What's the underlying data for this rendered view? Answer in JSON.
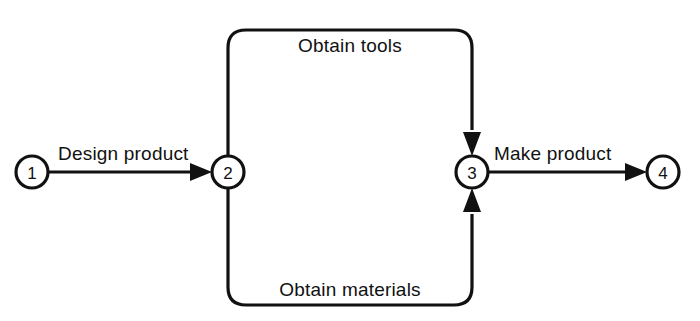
{
  "diagram": {
    "type": "activity-on-arrow-network",
    "title": "",
    "background_color": "#ffffff",
    "line_color": "#111111",
    "nodes": [
      {
        "id": "1",
        "label": "1",
        "cx": 32,
        "cy": 172,
        "r": 16
      },
      {
        "id": "2",
        "label": "2",
        "cx": 228,
        "cy": 172,
        "r": 16
      },
      {
        "id": "3",
        "label": "3",
        "cx": 472,
        "cy": 172,
        "r": 16
      },
      {
        "id": "4",
        "label": "4",
        "cx": 663,
        "cy": 172,
        "r": 16
      }
    ],
    "edges": [
      {
        "id": "design-product",
        "label": "Design product",
        "from": "1",
        "to": "2",
        "direction": "right",
        "label_x": 58,
        "label_y": 160
      },
      {
        "id": "obtain-tools",
        "label": "Obtain tools",
        "from": "2",
        "to": "3",
        "direction": "down",
        "route": "top",
        "label_x": 350,
        "label_y": 52
      },
      {
        "id": "obtain-materials",
        "label": "Obtain materials",
        "from": "2",
        "to": "3",
        "direction": "up",
        "route": "bottom",
        "label_x": 350,
        "label_y": 296
      },
      {
        "id": "make-product",
        "label": "Make product",
        "from": "3",
        "to": "4",
        "direction": "right",
        "label_x": 494,
        "label_y": 160
      }
    ]
  }
}
